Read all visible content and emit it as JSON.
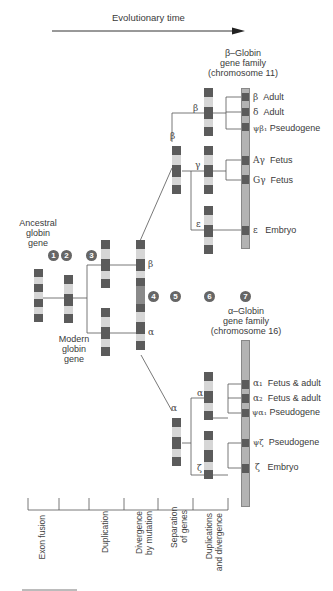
{
  "header": {
    "axis_title": "Evolutionary time"
  },
  "ancestral": {
    "line1": "Ancestral",
    "line2": "globin",
    "line3": "gene"
  },
  "modern": {
    "line1": "Modern",
    "line2": "globin",
    "line3": "gene"
  },
  "steps": [
    "1",
    "2",
    "3",
    "4",
    "5",
    "6",
    "7"
  ],
  "beta_family": {
    "title1": "β–Globin",
    "title2": "gene family",
    "title3": "(chromosome 11)",
    "genes": [
      {
        "symbol": "β",
        "role": "Adult"
      },
      {
        "symbol": "δ",
        "role": "Adult"
      },
      {
        "symbol": "ψβ₁",
        "role": "Pseudogene"
      },
      {
        "symbol": "Aγ",
        "role": "Fetus"
      },
      {
        "symbol": "Gγ",
        "role": "Fetus"
      },
      {
        "symbol": "ε",
        "role": "Embryo"
      }
    ]
  },
  "alpha_family": {
    "title1": "α–Globin",
    "title2": "gene family",
    "title3": "(chromosome 16)",
    "genes": [
      {
        "symbol": "α₁",
        "role": "Fetus & adult"
      },
      {
        "symbol": "α₂",
        "role": "Fetus & adult"
      },
      {
        "symbol": "ψα₁",
        "role": "Pseudogene"
      },
      {
        "symbol": "ψζ",
        "role": "Pseudogene"
      },
      {
        "symbol": "ζ",
        "role": "Embryo"
      }
    ]
  },
  "branch_labels": {
    "beta_main": "β",
    "alpha_main": "α",
    "beta_upper": "β",
    "beta_sub": "β",
    "gamma": "γ",
    "epsilon": "ε",
    "alpha_upper": "α",
    "alpha_sub": "α",
    "zeta": "ζ"
  },
  "timeline": {
    "stages": [
      "Exon fusion",
      "Duplication",
      "Divergence\nby mutation",
      "Separation\nof genes",
      "Duplications\nand divergence"
    ],
    "stage_lines": [
      [
        "Exon fusion"
      ],
      [
        "Duplication"
      ],
      [
        "Divergence",
        "by mutation"
      ],
      [
        "Separation",
        "of genes"
      ],
      [
        "Duplications",
        "and divergence"
      ]
    ]
  }
}
